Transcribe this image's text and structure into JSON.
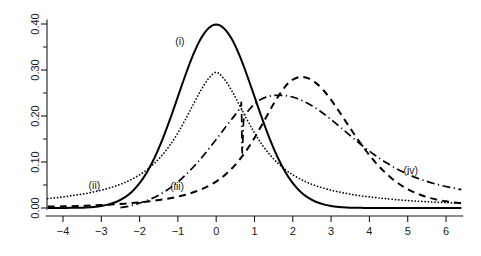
{
  "chart_data": {
    "type": "line",
    "title": "",
    "xlabel": "",
    "ylabel": "",
    "xlim": [
      -4.45,
      6.45
    ],
    "ylim": [
      -0.012,
      0.425
    ],
    "grid": false,
    "legend_position": "inline-annotations",
    "x_ticks": [
      -4,
      -3,
      -2,
      -1,
      0,
      1,
      2,
      3,
      4,
      5,
      6
    ],
    "x_tick_labels": [
      "-4",
      "-3",
      "-2",
      "-1",
      "0",
      "1",
      "2",
      "3",
      "4",
      "5",
      "6"
    ],
    "y_ticks": [
      0.0,
      0.05,
      0.1,
      0.15,
      0.2,
      0.25,
      0.3,
      0.35,
      0.4
    ],
    "y_tick_labels_major": [
      "0.00",
      "0.10",
      "0.20",
      "0.30",
      "0.40"
    ],
    "y_major_values": [
      0.0,
      0.1,
      0.2,
      0.3,
      0.4
    ],
    "y_minor_values": [
      0.05,
      0.15,
      0.25,
      0.35
    ],
    "annotations": [
      {
        "label": "(i)",
        "x": -0.95,
        "y": 0.355,
        "curve": "curve-i"
      },
      {
        "label": "(ii)",
        "x": -3.18,
        "y": 0.042,
        "curve": "curve-ii"
      },
      {
        "label": "(iii)",
        "x": -1.02,
        "y": 0.04,
        "curve": "curve-iii"
      },
      {
        "label": "(iv)",
        "x": 5.08,
        "y": 0.075,
        "curve": "curve-iv"
      }
    ],
    "series": [
      {
        "name": "(i)",
        "style": "solid",
        "description": "standard normal density, peak 0.40 at x = 0",
        "peak_x": 0.0,
        "peak_y": 0.399,
        "x": [
          -4.4,
          -4.2,
          -4.0,
          -3.8,
          -3.6,
          -3.4,
          -3.2,
          -3.0,
          -2.8,
          -2.6,
          -2.4,
          -2.2,
          -2.0,
          -1.8,
          -1.6,
          -1.4,
          -1.2,
          -1.0,
          -0.8,
          -0.6,
          -0.4,
          -0.2,
          0.0,
          0.2,
          0.4,
          0.6,
          0.8,
          1.0,
          1.2,
          1.4,
          1.6,
          1.8,
          2.0,
          2.2,
          2.4,
          2.6,
          2.8,
          3.0,
          3.2,
          3.4,
          3.6,
          3.8,
          4.0,
          4.4,
          4.8,
          5.2,
          5.6,
          6.0,
          6.4
        ],
        "y": [
          0.0,
          0.0001,
          0.0001,
          0.0003,
          0.0006,
          0.0012,
          0.0024,
          0.0044,
          0.0079,
          0.0136,
          0.0224,
          0.0355,
          0.054,
          0.079,
          0.1109,
          0.1497,
          0.1942,
          0.242,
          0.2897,
          0.3332,
          0.3683,
          0.391,
          0.3989,
          0.391,
          0.3683,
          0.3332,
          0.2897,
          0.242,
          0.1942,
          0.1497,
          0.1109,
          0.079,
          0.054,
          0.0355,
          0.0224,
          0.0136,
          0.0079,
          0.0044,
          0.0024,
          0.0012,
          0.0006,
          0.0003,
          0.0001,
          0.0,
          0.0,
          0.0,
          0.0,
          0.0,
          0.0
        ]
      },
      {
        "name": "(ii)",
        "style": "dotted",
        "description": "heavy-tailed symmetric density, peak ~0.32 at x = 0",
        "peak_x": 0.0,
        "peak_y": 0.32,
        "x": [
          -4.4,
          -4.2,
          -4.0,
          -3.8,
          -3.6,
          -3.4,
          -3.2,
          -3.0,
          -2.8,
          -2.6,
          -2.4,
          -2.2,
          -2.0,
          -1.8,
          -1.6,
          -1.4,
          -1.2,
          -1.0,
          -0.8,
          -0.6,
          -0.4,
          -0.2,
          0.0,
          0.2,
          0.4,
          0.6,
          0.8,
          1.0,
          1.2,
          1.4,
          1.6,
          1.8,
          2.0,
          2.2,
          2.4,
          2.6,
          2.8,
          3.0,
          3.2,
          3.4,
          3.6,
          3.8,
          4.0,
          4.2,
          4.4,
          4.8,
          5.2,
          5.6,
          6.0,
          6.4
        ],
        "y": [
          0.0205,
          0.0222,
          0.0241,
          0.0263,
          0.0288,
          0.0316,
          0.0349,
          0.0387,
          0.0432,
          0.0485,
          0.0549,
          0.0627,
          0.0722,
          0.0838,
          0.0982,
          0.1159,
          0.1375,
          0.1633,
          0.193,
          0.2249,
          0.2559,
          0.2813,
          0.295,
          0.2813,
          0.2559,
          0.2249,
          0.193,
          0.1633,
          0.1375,
          0.1159,
          0.0982,
          0.0838,
          0.0722,
          0.0627,
          0.0549,
          0.0485,
          0.0432,
          0.0387,
          0.0349,
          0.0316,
          0.0288,
          0.0263,
          0.0241,
          0.0222,
          0.0205,
          0.0175,
          0.0151,
          0.0132,
          0.0116,
          0.0103
        ]
      },
      {
        "name": "(iii)",
        "style": "dashed",
        "description": "right-shifted skewed density, peak ~0.285 near x = 2.2",
        "peak_x": 2.2,
        "peak_y": 0.285,
        "x": [
          -4.4,
          -4.0,
          -3.6,
          -3.2,
          -2.8,
          -2.4,
          -2.0,
          -1.6,
          -1.2,
          -0.8,
          -0.4,
          0.0,
          0.3,
          0.6,
          0.9,
          1.2,
          1.5,
          1.8,
          2.0,
          2.2,
          2.4,
          2.6,
          2.8,
          3.0,
          3.2,
          3.4,
          3.6,
          3.8,
          4.0,
          4.2,
          4.4,
          4.6,
          4.8,
          5.0,
          5.2,
          5.4,
          5.6,
          5.8,
          6.0,
          6.2,
          6.4
        ],
        "y": [
          0.003,
          0.0036,
          0.0045,
          0.0057,
          0.0073,
          0.0094,
          0.0122,
          0.016,
          0.0213,
          0.0288,
          0.04,
          0.0575,
          0.077,
          0.104,
          0.139,
          0.1815,
          0.2265,
          0.264,
          0.279,
          0.285,
          0.282,
          0.272,
          0.256,
          0.235,
          0.211,
          0.186,
          0.161,
          0.137,
          0.115,
          0.095,
          0.078,
          0.063,
          0.051,
          0.041,
          0.033,
          0.0265,
          0.0215,
          0.0175,
          0.0145,
          0.0122,
          0.0105
        ]
      },
      {
        "name": "(iv)",
        "style": "dash-dot",
        "description": "density with sharp vertical drop near x = 0.65, peak ~0.245 near x = 1.7, slow right tail",
        "peak_x": 1.7,
        "peak_y": 0.245,
        "x": [
          -2.5,
          -2.3,
          -2.1,
          -1.9,
          -1.7,
          -1.5,
          -1.3,
          -1.1,
          -0.9,
          -0.7,
          -0.5,
          -0.3,
          -0.1,
          0.1,
          0.3,
          0.5,
          0.63,
          0.66,
          0.68,
          0.72,
          0.8,
          0.95,
          1.1,
          1.3,
          1.5,
          1.7,
          1.9,
          2.1,
          2.3,
          2.5,
          2.7,
          2.9,
          3.1,
          3.3,
          3.5,
          3.7,
          3.9,
          4.1,
          4.3,
          4.5,
          4.7,
          4.9,
          5.1,
          5.3,
          5.5,
          5.7,
          5.9,
          6.1,
          6.3,
          6.4
        ],
        "y": [
          0.001,
          0.0035,
          0.008,
          0.0135,
          0.02,
          0.028,
          0.038,
          0.05,
          0.064,
          0.08,
          0.098,
          0.1175,
          0.1385,
          0.16,
          0.182,
          0.203,
          0.218,
          0.223,
          0.12,
          0.193,
          0.207,
          0.222,
          0.233,
          0.241,
          0.2445,
          0.245,
          0.243,
          0.2385,
          0.2315,
          0.2225,
          0.2115,
          0.199,
          0.1855,
          0.1715,
          0.1575,
          0.1435,
          0.13,
          0.1175,
          0.106,
          0.0955,
          0.086,
          0.0775,
          0.07,
          0.0635,
          0.0578,
          0.0528,
          0.0485,
          0.0448,
          0.0415,
          0.04
        ]
      }
    ]
  },
  "axes": {
    "y_axis_name": "y-axis",
    "x_axis_name": "x-axis"
  }
}
